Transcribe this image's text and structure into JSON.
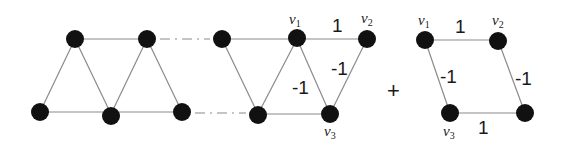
{
  "diagram": {
    "colors": {
      "node": "#111111",
      "edge": "#8a8a8a",
      "text": "#1a1a1a"
    },
    "left_strip": {
      "nodes": [
        [
          75,
          39
        ],
        [
          147,
          39
        ],
        [
          40,
          112
        ],
        [
          111,
          116
        ],
        [
          182,
          112
        ]
      ]
    },
    "middle": {
      "labels": {
        "v1": "v",
        "v1_sub": "1",
        "v2": "v",
        "v2_sub": "2",
        "v3": "v",
        "v3_sub": "3"
      },
      "weights": {
        "v1_v2": "1",
        "v2_v3": "-1",
        "v1_v3": "-1"
      }
    },
    "operator": "+",
    "right_rhombus": {
      "labels": {
        "v1": "v",
        "v1_sub": "1",
        "v2": "v",
        "v2_sub": "2",
        "v3": "v",
        "v3_sub": "3"
      },
      "weights": {
        "top": "1",
        "left": "-1",
        "right": "-1",
        "bottom": "1"
      }
    }
  }
}
